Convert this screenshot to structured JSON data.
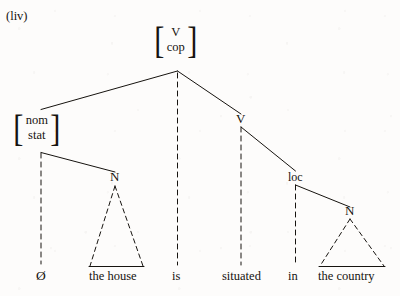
{
  "figure": {
    "example_number": "(liv)",
    "type": "syntactic-tree-diagram",
    "ink_color": "#16130f",
    "background_color": "#fdfcfb"
  },
  "nodes": {
    "root": {
      "label_lines": [
        "V",
        "cop"
      ],
      "bracketed": true
    },
    "subject": {
      "label_lines": [
        "nom",
        "stat"
      ],
      "bracketed": true
    },
    "verb": {
      "label": "V"
    },
    "locative": {
      "label": "loc"
    },
    "noun_left": {
      "label": "N"
    },
    "noun_right": {
      "label": "N"
    }
  },
  "terminals": {
    "null_subject": "Ø",
    "subject_phrase": "the house",
    "copula": "is",
    "participle": "situated",
    "preposition": "in",
    "locative_phrase": "the country"
  }
}
